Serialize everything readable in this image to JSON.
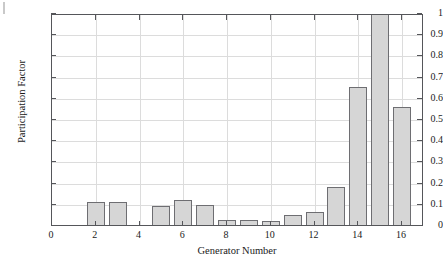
{
  "figure": {
    "background_color": "#ffffff",
    "axis_color": "#55565a",
    "grid_color": "#dcdcdc",
    "bar_fill_color": "#d6d6d6",
    "bar_edge_color": "#6e6e72"
  },
  "chart_data": {
    "type": "bar",
    "title": "",
    "subtitle": "",
    "xlabel": "Generator Number",
    "ylabel": "Participation Factor",
    "xlim": [
      0,
      17
    ],
    "ylim": [
      0,
      1
    ],
    "grid": true,
    "legend": null,
    "categories": [
      1,
      2,
      3,
      4,
      5,
      6,
      7,
      8,
      9,
      10,
      11,
      12,
      13,
      14,
      15,
      16
    ],
    "values": [
      0.0,
      0.107,
      0.107,
      0.0,
      0.09,
      0.12,
      0.096,
      0.022,
      0.026,
      0.019,
      0.048,
      0.062,
      0.181,
      0.651,
      1.0,
      0.556
    ],
    "x_ticks": [
      0,
      2,
      4,
      6,
      8,
      10,
      12,
      14,
      16
    ],
    "x_tick_labels": [
      "0",
      "2",
      "4",
      "6",
      "8",
      "10",
      "12",
      "14",
      "16"
    ],
    "y_ticks": [
      0,
      0.1,
      0.2,
      0.3,
      0.4,
      0.5,
      0.6,
      0.7,
      0.8,
      0.9,
      1
    ],
    "y_tick_labels": [
      "0",
      "0.1",
      "0.2",
      "0.3",
      "0.4",
      "0.5",
      "0.6",
      "0.7",
      "0.8",
      "0.9",
      "1"
    ]
  }
}
